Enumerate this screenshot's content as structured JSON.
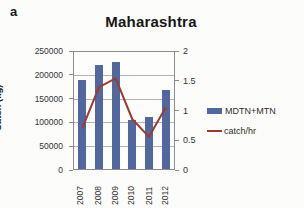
{
  "panel_label": "a",
  "chart_data": {
    "type": "bar+line",
    "title": "Maharashtra",
    "categories": [
      "2007",
      "2008",
      "2009",
      "2010",
      "2011",
      "2012"
    ],
    "series": [
      {
        "name": "MDTN+MTN",
        "type": "bar",
        "axis": "left",
        "values": [
          190000,
          222000,
          228000,
          105000,
          112000,
          168000
        ]
      },
      {
        "name": "catch/hr",
        "type": "line",
        "axis": "right",
        "values": [
          0.7,
          1.4,
          1.55,
          0.85,
          0.55,
          1.05
        ]
      }
    ],
    "ylabel_left": "Catch (kg)",
    "ylim_left": [
      0,
      250000
    ],
    "yticks_left": [
      "250000",
      "200000",
      "150000",
      "100000",
      "50000",
      "0"
    ],
    "ylim_right": [
      0,
      2
    ],
    "yticks_right": [
      "2",
      "1.5",
      "1",
      "0.5",
      "0"
    ],
    "grid": true,
    "legend_position": "right"
  },
  "colors": {
    "bar": "#50689e",
    "line": "#9d3b30",
    "grid": "#b3b3b3",
    "axis_line": "#8c8c8c",
    "title_text": "#171717",
    "tick_text": "#333333",
    "background": "#fcfcfb"
  }
}
